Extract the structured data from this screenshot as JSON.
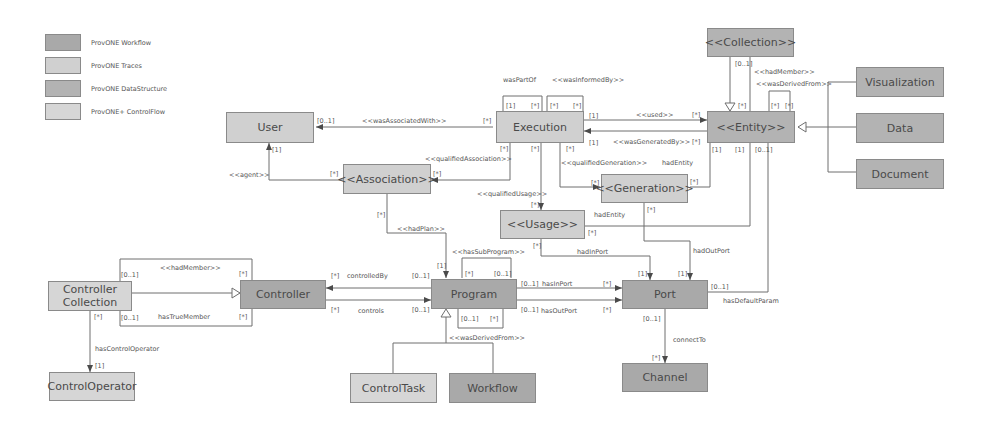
{
  "legend": [
    {
      "label": "ProvONE Workflow",
      "color": "#a9a9a9"
    },
    {
      "label": "ProvONE Traces",
      "color": "#d0d0d0"
    },
    {
      "label": "ProvONE DataStructure",
      "color": "#b3b3b3"
    },
    {
      "label": "ProvONE+ ControlFlow",
      "color": "#d6d6d6"
    }
  ],
  "nodes": {
    "user": "User",
    "execution": "Execution",
    "association": "<<Association>>",
    "generation": "<<Generation>>",
    "usage": "<<Usage>>",
    "collection": "<<Collection>>",
    "entity": "<<Entity>>",
    "visualization": "Visualization",
    "data": "Data",
    "document": "Document",
    "controller_collection": "Controller Collection",
    "controller": "Controller",
    "program": "Program",
    "port": "Port",
    "control_operator": "ControlOperator",
    "control_task": "ControlTask",
    "workflow": "Workflow",
    "channel": "Channel"
  },
  "labels": {
    "wasPartOf": "wasPartOf",
    "wasInformedBy": "<<wasInformedBy>>",
    "wasAssociatedWith": "<<wasAssociatedWith>>",
    "qualifiedAssociation": "<<qualifiedAssociation>>",
    "agent": "<<agent>>",
    "used": "<<used>>",
    "wasGeneratedBy": "<<wasGeneratedBy>>",
    "qualifiedGeneration": "<<qualifiedGeneration>>",
    "hadEntity1": "hadEntity",
    "hadEntity2": "hadEntity",
    "qualifiedUsage": "<<qualifiedUsage>>",
    "hadPlan": "<<hadPlan>>",
    "hasSubProgram": "<<hasSubProgram>>",
    "hadInPort": "hadInPort",
    "hadOutPort": "hadOutPort",
    "hadMember_entity": "<<hadMember>>",
    "wasDerivedFrom_entity": "<<wasDerivedFrom>>",
    "hadMember_ctrl": "<<hadMember>>",
    "hasTrueMember": "hasTrueMember",
    "controlledBy": "controlledBy",
    "controls": "controls",
    "hasInPort": "hasInPort",
    "hasOutPort": "hasOutPort",
    "hasDefaultParam": "hasDefaultParam",
    "connectTo": "connectTo",
    "hasControlOperator": "hasControlOperator",
    "wasDerivedFrom_prog": "<<wasDerivedFrom>>"
  },
  "multiplicities": {
    "one": "[1]",
    "many": "[*]",
    "opt": "[0..1]"
  }
}
